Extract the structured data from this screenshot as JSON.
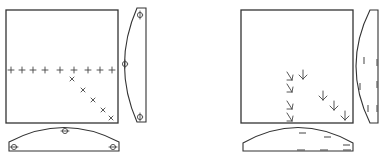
{
  "figure": {
    "panels": [
      {
        "id": "left",
        "description": "Square field with a horizontal row of plus markers and a diagonal of x markers, plus side and bottom projection lenses with circle-bar markers",
        "square": {
          "x": 6,
          "y": 10,
          "w": 112,
          "h": 113
        },
        "plus_markers": [
          {
            "x": 11,
            "y": 70
          },
          {
            "x": 22,
            "y": 70
          },
          {
            "x": 33,
            "y": 70
          },
          {
            "x": 45,
            "y": 70
          },
          {
            "x": 60,
            "y": 70
          },
          {
            "x": 74,
            "y": 70
          },
          {
            "x": 88,
            "y": 70
          },
          {
            "x": 100,
            "y": 70
          },
          {
            "x": 112,
            "y": 70
          }
        ],
        "x_markers": [
          {
            "x": 72,
            "y": 79
          },
          {
            "x": 83,
            "y": 90
          },
          {
            "x": 93,
            "y": 100
          },
          {
            "x": 103,
            "y": 110
          },
          {
            "x": 111,
            "y": 118
          }
        ],
        "side_lens": {
          "markers": [
            {
              "x": 139,
              "y": 15
            },
            {
              "x": 125,
              "y": 64
            },
            {
              "x": 139,
              "y": 117
            }
          ]
        },
        "bottom_lens": {
          "markers": [
            {
              "x": 65,
              "y": 131
            },
            {
              "x": 14,
              "y": 147
            },
            {
              "x": 113,
              "y": 147
            }
          ]
        }
      },
      {
        "id": "right",
        "description": "Square field with downward arrow markers, plus side and bottom projection lenses with dash markers",
        "square": {
          "x": 241,
          "y": 10,
          "w": 112,
          "h": 113
        },
        "arrow_markers": [
          {
            "x": 290,
            "y": 76,
            "type": "diag"
          },
          {
            "x": 303,
            "y": 74,
            "type": "down"
          },
          {
            "x": 290,
            "y": 88,
            "type": "diag"
          },
          {
            "x": 290,
            "y": 106,
            "type": "diag"
          },
          {
            "x": 290,
            "y": 117,
            "type": "diag"
          },
          {
            "x": 323,
            "y": 95,
            "type": "down"
          },
          {
            "x": 333,
            "y": 105,
            "type": "down"
          },
          {
            "x": 345,
            "y": 115,
            "type": "down"
          }
        ],
        "side_lens": {
          "inner_dashes": [
            {
              "x": 364,
              "y": 60
            },
            {
              "x": 360,
              "y": 86
            },
            {
              "x": 368,
              "y": 108
            }
          ],
          "edge_dashes": [
            {
              "x": 376,
              "y": 62
            },
            {
              "x": 376,
              "y": 84
            },
            {
              "x": 376,
              "y": 108
            }
          ]
        },
        "bottom_lens": {
          "inner_dashes": [
            {
              "x": 302,
              "y": 133
            },
            {
              "x": 328,
              "y": 137
            },
            {
              "x": 347,
              "y": 145
            }
          ],
          "edge_dashes": [
            {
              "x": 301,
              "y": 150
            },
            {
              "x": 324,
              "y": 150
            },
            {
              "x": 347,
              "y": 150
            }
          ]
        }
      }
    ]
  }
}
